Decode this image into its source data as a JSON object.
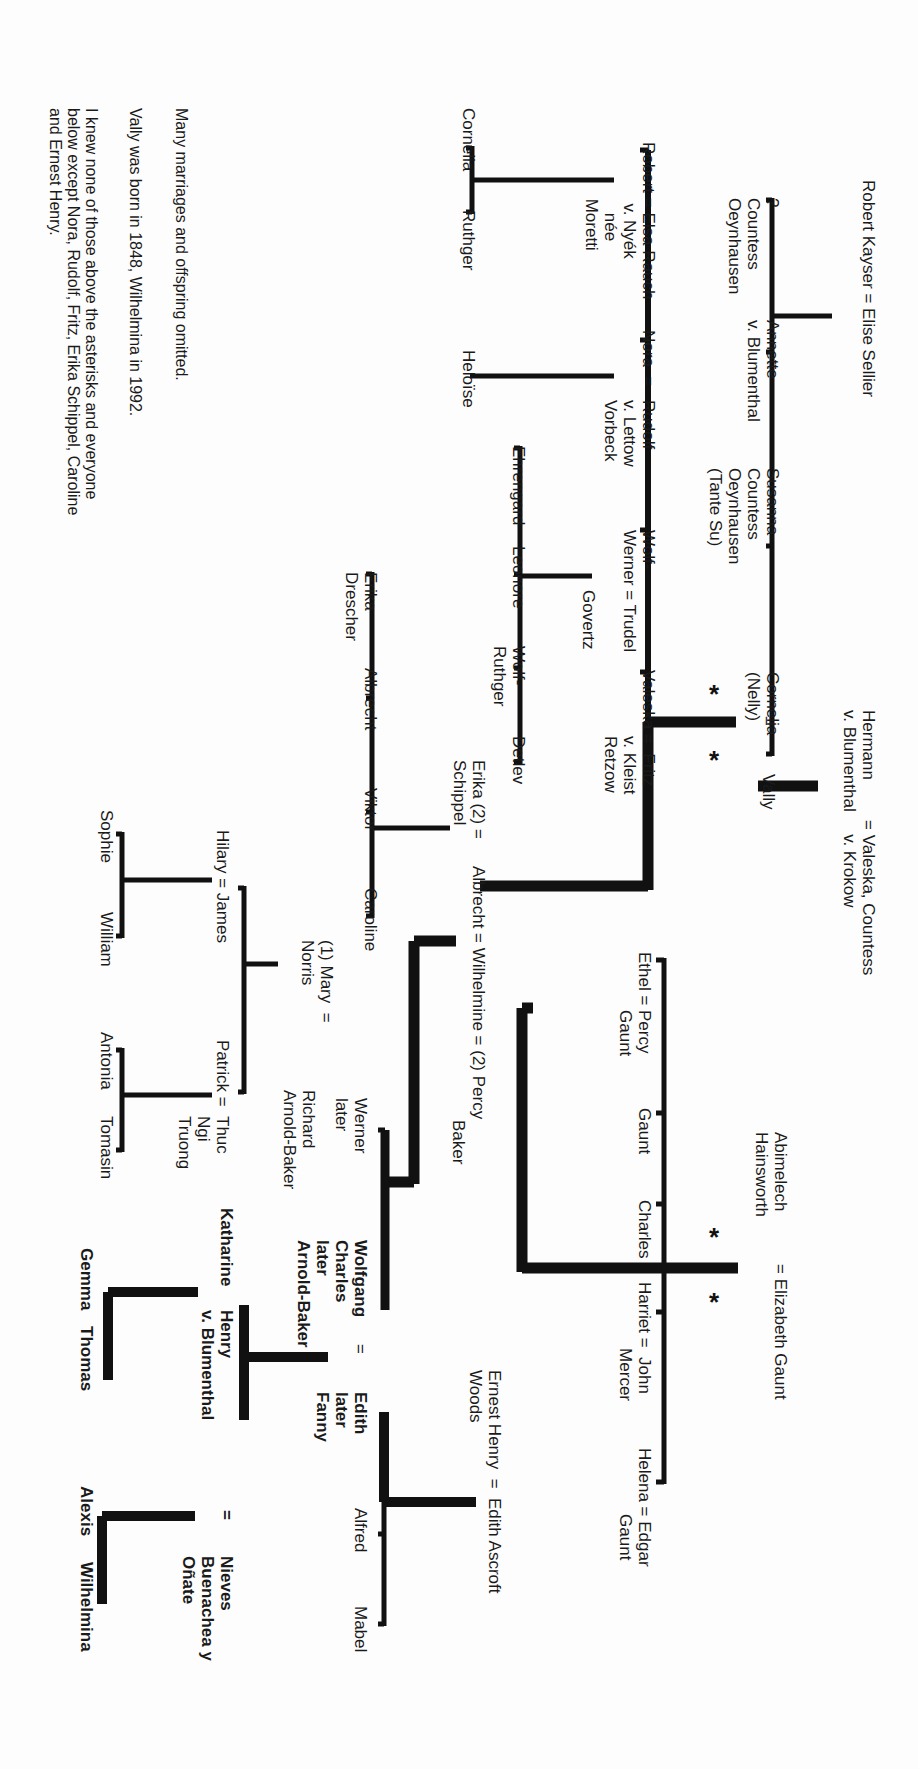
{
  "notes": [
    "Many marriages and offspring omitted.",
    "Vally was born in 1848, Wilhelmina in 1992.",
    "I knew none of those above the asterisks and everyone\nbelow except Nora, Rudolf, Fritz, Erika Schippel, Caroline\nand Ernest Henry."
  ],
  "people": {
    "robert_kayser": "Robert Kayser = Elise Sellier",
    "unknown": "?\nCountess\nOeynhausen",
    "annette": "Annette\nv. Blumenthal",
    "susanna": "Susanna\nCountess\nOeynhausen\n(Tante Su)",
    "cornelia_nelly": "Cornelia\n(Nelly)",
    "hermann": "Hermann\nv. Blumenthal",
    "valeska_countess": "= Valeska, Countess\n   v. Krokow",
    "vally_eq": "=",
    "vally": "Vally",
    "robert_elsa": "Robert = Elsa Rauch\n             v. Nyék\n               née\n            Moretti",
    "nora": "Nora  =",
    "rudolf": "Rudolf\nv. Lettow\nVorbeck",
    "wolf_werner": "Wolf-\nWerner = Trudel",
    "govertz": "Govertz",
    "valeska_fritz": "Valeska =  Fritz\n              v. Kleist\n              Retzow",
    "cornelia": "Cornelia",
    "ruthger": "Ruthger",
    "heloise": "Heloïse",
    "ehrengard": "Ehrengard",
    "leonore": "Leonore",
    "wolf_ruthger": "Wolf-\nRuthger",
    "detlev": "Detlev",
    "erika_schippel": "Erika (2) =\nSchippel",
    "albrecht_main": "Albrecht = Wilhelmine = (2) Percy",
    "percy_baker": "Baker",
    "erika_drescher": "Erika\nDrescher",
    "albrecht_child": "Albrecht",
    "viktor": "Viktor",
    "caroline": "Caroline",
    "ethel": "Ethel =",
    "percy_gaunt": "Percy\nGaunt",
    "gaunt": "Gaunt",
    "charles": "Charles",
    "abimelech": "Abimelech\nHainsworth",
    "elizabeth_eq": "= Elizabeth Gaunt",
    "harriet": "Harriet =  John\n              Mercer",
    "helena": "Helena = Edgar\n              Gaunt",
    "mary_norris": "(1) Mary  =\nNorris",
    "richard": "Richard\nArnold-Baker",
    "werner_later": "Werner\nlater",
    "wolfgang": "Wolfgang\nCharles\nlater\nArnold-Baker",
    "wolfgang_eq": "=",
    "edith_fanny": "Edith\nlater\nFanny",
    "ernest_henry": "Ernest Henry  =  Edith Ascroft\nWoods",
    "alfred": "Alfred",
    "mabel": "Mabel",
    "hilary_james": "Hilary = James",
    "patrick": "Patrick =",
    "thuc": "Thuc\nNgi\nTruong",
    "sophie": "Sophie",
    "william": "William",
    "antonia": "Antonia",
    "tomasin": "Tomasin",
    "katharine": "Katharine",
    "henry": "Henry\nv. Blumenthal",
    "henry_eq": "=",
    "nieves": "Nieves\nBuenachea y\nOñate",
    "gemma": "Gemma",
    "thomas": "Thomas",
    "alexis": "Alexis",
    "wilhelmina": "Wilhelmina"
  },
  "markers": {
    "asterisk": "*"
  },
  "colors": {
    "ink": "#111111",
    "paper": "#fdfdfd"
  }
}
